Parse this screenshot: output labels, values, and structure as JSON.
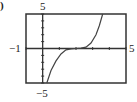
{
  "panel_label": ")",
  "chart_data": {
    "type": "line",
    "title": "",
    "xlabel": "",
    "ylabel": "",
    "xlim": [
      -1,
      5
    ],
    "ylim": [
      -5,
      5
    ],
    "grid": false,
    "x_tick_step": 1,
    "y_tick_step": 1,
    "window_labels": {
      "xmin": "−1",
      "xmax": "5",
      "ymin": "−5",
      "ymax": "5"
    },
    "series": [
      {
        "name": "f(x)",
        "x": [
          0.25,
          0.5,
          0.8,
          1.1,
          1.4,
          1.7,
          2.0,
          2.3,
          2.6,
          2.9,
          3.2,
          3.4,
          3.6
        ],
        "y": [
          -5,
          -3.2,
          -1.8,
          -0.8,
          -0.2,
          -0.05,
          0,
          0.05,
          0.2,
          0.8,
          2.0,
          3.3,
          5
        ]
      }
    ]
  }
}
